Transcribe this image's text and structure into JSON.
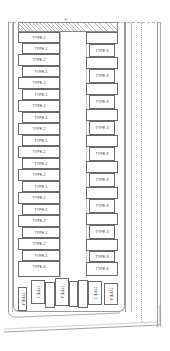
{
  "plan": {
    "north_marker": "+",
    "left_column": [
      {
        "label": "TYPE-2",
        "y": 32,
        "h": 11,
        "x": 18,
        "w": 42
      },
      {
        "label": "TYPE-1",
        "y": 43,
        "h": 11,
        "x": 22,
        "w": 38
      },
      {
        "label": "TYPE-2",
        "y": 54,
        "h": 12,
        "x": 18,
        "w": 42
      },
      {
        "label": "TYPE-1",
        "y": 66,
        "h": 11,
        "x": 22,
        "w": 38
      },
      {
        "label": "TYPE-2",
        "y": 77,
        "h": 12,
        "x": 18,
        "w": 42
      },
      {
        "label": "TYPE-1",
        "y": 89,
        "h": 11,
        "x": 22,
        "w": 38
      },
      {
        "label": "TYPE-2",
        "y": 100,
        "h": 12,
        "x": 18,
        "w": 42
      },
      {
        "label": "TYPE-1",
        "y": 112,
        "h": 11,
        "x": 22,
        "w": 38
      },
      {
        "label": "TYPE-2",
        "y": 123,
        "h": 12,
        "x": 18,
        "w": 42
      },
      {
        "label": "TYPE-1",
        "y": 135,
        "h": 11,
        "x": 22,
        "w": 38
      },
      {
        "label": "TYPE-2",
        "y": 146,
        "h": 12,
        "x": 18,
        "w": 42
      },
      {
        "label": "TYPE-1",
        "y": 158,
        "h": 11,
        "x": 22,
        "w": 38
      },
      {
        "label": "TYPE-2",
        "y": 169,
        "h": 12,
        "x": 18,
        "w": 42
      },
      {
        "label": "TYPE-1",
        "y": 181,
        "h": 11,
        "x": 22,
        "w": 38
      },
      {
        "label": "TYPE-2",
        "y": 192,
        "h": 12,
        "x": 18,
        "w": 42
      },
      {
        "label": "TYPE-1",
        "y": 204,
        "h": 11,
        "x": 22,
        "w": 38
      },
      {
        "label": "TYPE-2",
        "y": 215,
        "h": 12,
        "x": 18,
        "w": 42
      },
      {
        "label": "TYPE-1",
        "y": 227,
        "h": 11,
        "x": 22,
        "w": 38
      },
      {
        "label": "TYPE-2",
        "y": 238,
        "h": 12,
        "x": 18,
        "w": 42
      },
      {
        "label": "TYPE-1",
        "y": 250,
        "h": 11,
        "x": 22,
        "w": 38
      },
      {
        "label": "TYPE-4",
        "y": 261,
        "h": 16,
        "x": 18,
        "w": 42
      }
    ],
    "right_column": [
      {
        "label": "",
        "y": 32,
        "h": 12,
        "x": 86,
        "w": 32
      },
      {
        "label": "TYPE-3",
        "y": 44,
        "h": 13,
        "x": 89,
        "w": 26
      },
      {
        "label": "",
        "y": 57,
        "h": 12,
        "x": 86,
        "w": 32
      },
      {
        "label": "TYPE-3",
        "y": 69,
        "h": 14,
        "x": 89,
        "w": 26
      },
      {
        "label": "",
        "y": 83,
        "h": 12,
        "x": 86,
        "w": 32
      },
      {
        "label": "TYPE-3",
        "y": 95,
        "h": 14,
        "x": 89,
        "w": 26
      },
      {
        "label": "",
        "y": 109,
        "h": 12,
        "x": 86,
        "w": 32
      },
      {
        "label": "TYPE-3",
        "y": 121,
        "h": 14,
        "x": 89,
        "w": 26
      },
      {
        "label": "",
        "y": 135,
        "h": 12,
        "x": 86,
        "w": 32
      },
      {
        "label": "TYPE-3",
        "y": 147,
        "h": 14,
        "x": 89,
        "w": 26
      },
      {
        "label": "",
        "y": 161,
        "h": 12,
        "x": 86,
        "w": 32
      },
      {
        "label": "TYPE-3",
        "y": 173,
        "h": 14,
        "x": 89,
        "w": 26
      },
      {
        "label": "",
        "y": 187,
        "h": 12,
        "x": 86,
        "w": 32
      },
      {
        "label": "TYPE-3",
        "y": 199,
        "h": 14,
        "x": 89,
        "w": 26
      },
      {
        "label": "",
        "y": 213,
        "h": 12,
        "x": 86,
        "w": 32
      },
      {
        "label": "TYPE-3",
        "y": 225,
        "h": 14,
        "x": 89,
        "w": 26
      },
      {
        "label": "",
        "y": 239,
        "h": 12,
        "x": 86,
        "w": 32
      },
      {
        "label": "TYPE-3",
        "y": 251,
        "h": 11,
        "x": 89,
        "w": 26
      },
      {
        "label": "TYPE-4",
        "y": 262,
        "h": 14,
        "x": 86,
        "w": 32
      }
    ],
    "bottom_row": [
      {
        "label": "TYPE-4",
        "x": 18,
        "y": 287,
        "w": 9,
        "h": 24,
        "rotated": true
      },
      {
        "label": "TYPE-1",
        "x": 31,
        "y": 280,
        "w": 14,
        "h": 24,
        "rotated": true
      },
      {
        "label": "",
        "x": 45,
        "y": 282,
        "w": 10,
        "h": 26,
        "rotated": false
      },
      {
        "label": "TYPE-4",
        "x": 55,
        "y": 278,
        "w": 14,
        "h": 28,
        "rotated": true
      },
      {
        "label": "",
        "x": 69,
        "y": 281,
        "w": 9,
        "h": 26,
        "rotated": false
      },
      {
        "label": "",
        "x": 78,
        "y": 280,
        "w": 10,
        "h": 28,
        "rotated": false
      },
      {
        "label": "TYPE-1",
        "x": 88,
        "y": 281,
        "w": 14,
        "h": 24,
        "rotated": true
      },
      {
        "label": "TYPE-4",
        "x": 104,
        "y": 283,
        "w": 14,
        "h": 22,
        "rotated": true
      }
    ]
  },
  "colors": {
    "line": "#6a6a6a",
    "light_line": "#9a9a9a",
    "hatch": "#b8b8b8",
    "background": "#ffffff"
  }
}
